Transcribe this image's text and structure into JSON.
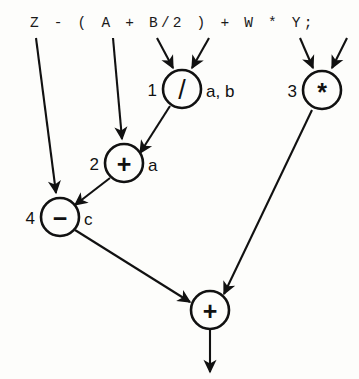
{
  "figure": {
    "kind": "expression-dag",
    "expression": "Z - ( A + B/2 ) + W * Y;",
    "background_color": "#fdfdfb",
    "stroke_color": "#111111"
  },
  "expression_tokens": [
    "Z",
    "-",
    "(",
    "A",
    "+",
    "B/2",
    ")",
    "+",
    "W",
    "*",
    "Y;"
  ],
  "nodes": [
    {
      "id": "node-1",
      "index": "1",
      "operator": "/",
      "register": "a, b",
      "cx": 182,
      "cy": 89,
      "r": 19
    },
    {
      "id": "node-2",
      "index": "2",
      "operator": "+",
      "register": "a",
      "cx": 124,
      "cy": 163,
      "r": 19
    },
    {
      "id": "node-3",
      "index": "3",
      "operator": "*",
      "register": "",
      "cx": 322,
      "cy": 90,
      "r": 19
    },
    {
      "id": "node-4",
      "index": "4",
      "operator": "−",
      "register": "c",
      "cx": 60,
      "cy": 217,
      "r": 19
    },
    {
      "id": "node-5",
      "index": "",
      "operator": "+",
      "register": "",
      "cx": 210,
      "cy": 310,
      "r": 19
    }
  ],
  "edges": [
    {
      "id": "edge-z-to-minus",
      "from": "Z",
      "to": "node-4",
      "x1": 36,
      "y1": 38,
      "x2": 56,
      "y2": 193
    },
    {
      "id": "edge-a-to-plus2",
      "from": "A",
      "to": "node-2",
      "x1": 113,
      "y1": 38,
      "x2": 122,
      "y2": 139
    },
    {
      "id": "edge-b-to-div",
      "from": "B",
      "to": "node-1",
      "x1": 157,
      "y1": 38,
      "x2": 173,
      "y2": 68
    },
    {
      "id": "edge-2-to-div",
      "from": "2",
      "to": "node-1",
      "x1": 209,
      "y1": 38,
      "x2": 192,
      "y2": 68
    },
    {
      "id": "edge-w-to-mul",
      "from": "W",
      "to": "node-3",
      "x1": 300,
      "y1": 38,
      "x2": 313,
      "y2": 68
    },
    {
      "id": "edge-y-to-mul",
      "from": "Y",
      "to": "node-3",
      "x1": 347,
      "y1": 38,
      "x2": 332,
      "y2": 68
    },
    {
      "id": "edge-div-to-plus2",
      "from": "node-1",
      "to": "node-2",
      "x1": 170,
      "y1": 106,
      "x2": 140,
      "y2": 153
    },
    {
      "id": "edge-plus2-to-sub",
      "from": "node-2",
      "to": "node-4",
      "x1": 110,
      "y1": 178,
      "x2": 75,
      "y2": 205
    },
    {
      "id": "edge-sub-to-plus",
      "from": "node-4",
      "to": "node-5",
      "x1": 75,
      "y1": 230,
      "x2": 190,
      "y2": 302
    },
    {
      "id": "edge-mul-to-plus",
      "from": "node-3",
      "to": "node-5",
      "x1": 312,
      "y1": 110,
      "x2": 224,
      "y2": 294
    },
    {
      "id": "edge-plus-out",
      "from": "node-5",
      "to": "result",
      "x1": 210,
      "y1": 330,
      "x2": 210,
      "y2": 372
    }
  ]
}
